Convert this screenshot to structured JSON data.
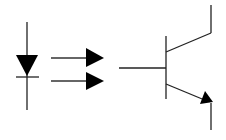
{
  "diagram": {
    "stroke_color": "#222222",
    "fill_color": "#000000",
    "background": "#ffffff",
    "components": [
      {
        "name": "LED / photodiode symbol",
        "type": "diode"
      },
      {
        "name": "Light emission arrows",
        "type": "arrows",
        "count": 2
      },
      {
        "name": "NPN phototransistor",
        "type": "bjt-npn"
      }
    ]
  }
}
